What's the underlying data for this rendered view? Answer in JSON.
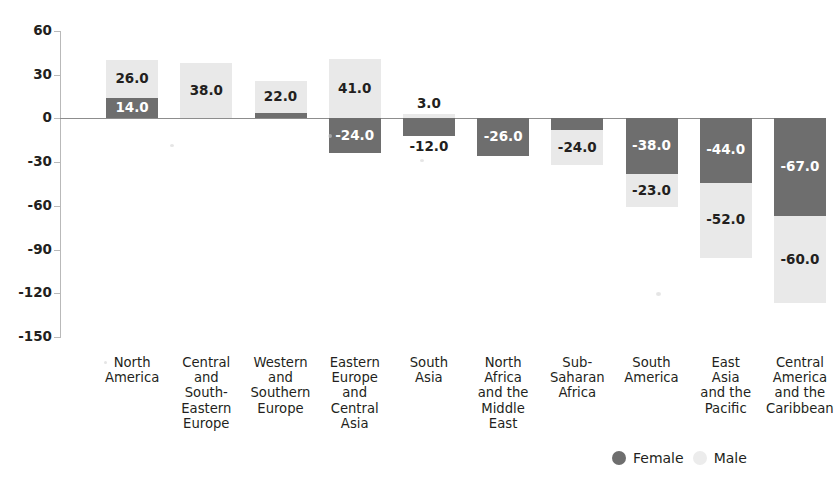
{
  "chart_data": {
    "type": "bar",
    "subtype": "stacked-bar-diverging",
    "title": "",
    "xlabel": "",
    "ylabel": "",
    "ylim": [
      -150,
      60
    ],
    "ytick_step": 30,
    "yticks": [
      "60",
      "30",
      "0",
      "-30",
      "-60",
      "-90",
      "-120",
      "-150"
    ],
    "grid": false,
    "legend_position": "bottom-right",
    "categories": [
      "North America",
      "Central and South-Eastern Europe",
      "Western and Southern Europe",
      "Eastern Europe and Central Asia",
      "South Asia",
      "North Africa and the Middle East",
      "Sub-Saharan Africa",
      "South America",
      "East Asia and the Pacific",
      "Central America and the Caribbean"
    ],
    "category_lines": [
      [
        "North",
        "America"
      ],
      [
        "Central",
        "and",
        "South-",
        "Eastern",
        "Europe"
      ],
      [
        "Western",
        "and",
        "Southern",
        "Europe"
      ],
      [
        "Eastern",
        "Europe",
        "and",
        "Central",
        "Asia"
      ],
      [
        "South",
        "Asia"
      ],
      [
        "North",
        "Africa",
        "and the",
        "Middle",
        "East"
      ],
      [
        "Sub-",
        "Saharan",
        "Africa"
      ],
      [
        "South",
        "America"
      ],
      [
        "East",
        "Asia",
        "and the",
        "Pacific"
      ],
      [
        "Central",
        "America",
        "and the",
        "Caribbean"
      ]
    ],
    "series": [
      {
        "name": "Female",
        "color": "#6e6e6e",
        "values": [
          14.0,
          null,
          4.0,
          -24.0,
          -12.0,
          -26.0,
          -8.0,
          -38.0,
          -44.0,
          -67.0
        ],
        "labels": [
          "14.0",
          "",
          "4.0",
          "-24.0",
          "-12.0",
          "-26.0",
          "-8.0",
          "-38.0",
          "-44.0",
          "-67.0"
        ]
      },
      {
        "name": "Male",
        "color": "#e9e9e9",
        "values": [
          26.0,
          38.0,
          22.0,
          41.0,
          3.0,
          null,
          -24.0,
          -23.0,
          -52.0,
          -60.0
        ],
        "labels": [
          "26.0",
          "38.0",
          "22.0",
          "41.0",
          "3.0",
          "",
          "-24.0",
          "-23.0",
          "-52.0",
          "-60.0"
        ]
      }
    ]
  },
  "legend": {
    "female_label": "Female",
    "male_label": "Male",
    "female_color": "#6e6e6e",
    "male_color": "#ececec"
  },
  "axis": {
    "tick_labels": [
      "60",
      "30",
      "0",
      "-30",
      "-60",
      "-90",
      "-120",
      "-150"
    ]
  }
}
